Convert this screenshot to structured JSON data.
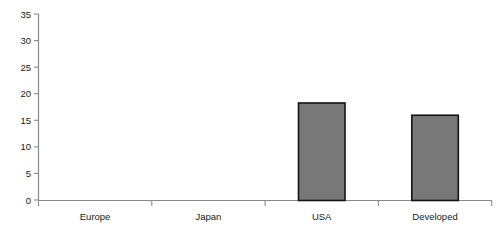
{
  "chart_data": {
    "type": "bar",
    "title": "",
    "subtitle": "",
    "xlabel": "",
    "ylabel": "",
    "categories": [
      "Europe",
      "Japan",
      "USA",
      "Developed"
    ],
    "values": [
      19.0,
      32.5,
      18.3,
      16.0
    ],
    "series": [
      {
        "name": "",
        "values": [
          19.0,
          32.5,
          18.3,
          16.0
        ]
      }
    ],
    "ylim": [
      0,
      35
    ],
    "yticks": [
      0,
      5,
      10,
      15,
      20,
      25,
      30,
      35
    ],
    "ytick_labels": [
      "0",
      "5",
      "10",
      "15",
      "20",
      "25",
      "30",
      "35"
    ],
    "grid": false,
    "legend": false,
    "legend_position": "none",
    "annotations": [],
    "colors": {
      "bar_fill": "#787878",
      "bar_border": "#141414",
      "axis": "#8a8a8a",
      "text": "#1a1a1a",
      "background": "#ffffff"
    }
  }
}
